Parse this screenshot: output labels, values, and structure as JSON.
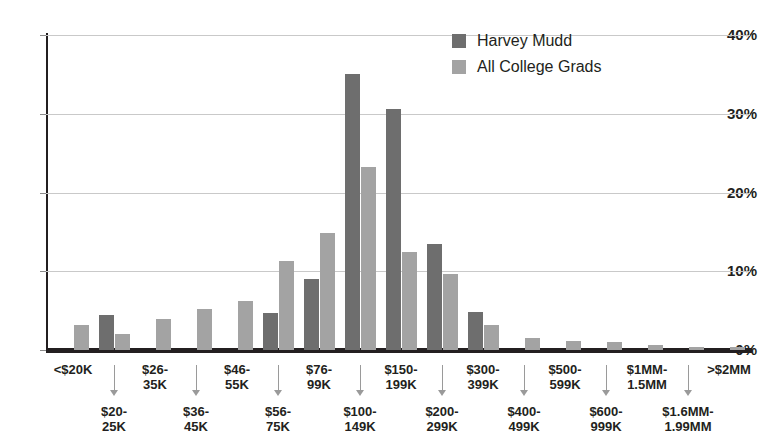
{
  "chart_data": {
    "type": "bar",
    "title": "",
    "subtitle": "",
    "xlabel": "",
    "ylabel": "",
    "ylim": [
      0,
      40
    ],
    "ytick_labels": [
      "0%",
      "10%",
      "20%",
      "30%",
      "40%"
    ],
    "ytick_values": [
      0,
      10,
      20,
      30,
      40
    ],
    "grid": true,
    "legend_position": "top-right",
    "categories": [
      "<$20K",
      "$20-25K",
      "$26-35K",
      "$36-45K",
      "$46-55K",
      "$56-75K",
      "$76-99K",
      "$100-149K",
      "$150-199K",
      "$200-299K",
      "$300-399K",
      "$400-499K",
      "$500-599K",
      "$600-999K",
      "$1MM-1.5MM",
      "$1.6MM-1.99MM",
      ">$2MM"
    ],
    "category_rows": [
      {
        "row": "top",
        "label": "<$20K"
      },
      {
        "row": "bottom",
        "label": "$20-25K"
      },
      {
        "row": "top",
        "label": "$26-35K"
      },
      {
        "row": "bottom",
        "label": "$36-45K"
      },
      {
        "row": "top",
        "label": "$46-55K"
      },
      {
        "row": "bottom",
        "label": "$56-75K"
      },
      {
        "row": "top",
        "label": "$76-99K"
      },
      {
        "row": "bottom",
        "label": "$100-149K"
      },
      {
        "row": "top",
        "label": "$150-199K"
      },
      {
        "row": "bottom",
        "label": "$200-299K"
      },
      {
        "row": "top",
        "label": "$300-399K"
      },
      {
        "row": "bottom",
        "label": "$400-499K"
      },
      {
        "row": "top",
        "label": "$500-599K"
      },
      {
        "row": "bottom",
        "label": "$600-999K"
      },
      {
        "row": "top",
        "label": "$1MM-1.5MM"
      },
      {
        "row": "bottom",
        "label": "$1.6MM-1.99MM"
      },
      {
        "row": "top",
        "label": ">$2MM"
      }
    ],
    "series": [
      {
        "name": "Harvey Mudd",
        "color": "#6e6e6e",
        "values": [
          0,
          4.5,
          0,
          0,
          0,
          4.7,
          9.0,
          35.0,
          30.6,
          13.5,
          4.8,
          0,
          0,
          0,
          0,
          0,
          0
        ]
      },
      {
        "name": "All College Grads",
        "color": "#a3a3a3",
        "values": [
          3.2,
          2.0,
          3.9,
          5.2,
          6.2,
          11.3,
          14.9,
          23.2,
          12.5,
          9.7,
          3.2,
          1.5,
          1.1,
          1.0,
          0.6,
          0.4,
          0.4
        ]
      }
    ]
  },
  "legend": {
    "items": [
      {
        "label": "Harvey Mudd",
        "swatch": "hm"
      },
      {
        "label": "All College Grads",
        "swatch": "acg"
      }
    ]
  },
  "axis_label_rows": {
    "top_labels": [
      [
        "<$20K"
      ],
      [
        "$26-",
        "35K"
      ],
      [
        "$46-",
        "55K"
      ],
      [
        "$76-",
        "99K"
      ],
      [
        "$150-",
        "199K"
      ],
      [
        "$300-",
        "399K"
      ],
      [
        "$500-",
        "599K"
      ],
      [
        "$1MM-",
        "1.5MM"
      ],
      [
        ">$2MM"
      ]
    ],
    "bottom_labels": [
      [
        "$20-",
        "25K"
      ],
      [
        "$36-",
        "45K"
      ],
      [
        "$56-",
        "75K"
      ],
      [
        "$100-",
        "149K"
      ],
      [
        "$200-",
        "299K"
      ],
      [
        "$400-",
        "499K"
      ],
      [
        "$600-",
        "999K"
      ],
      [
        "$1.6MM-",
        "1.99MM"
      ]
    ]
  }
}
